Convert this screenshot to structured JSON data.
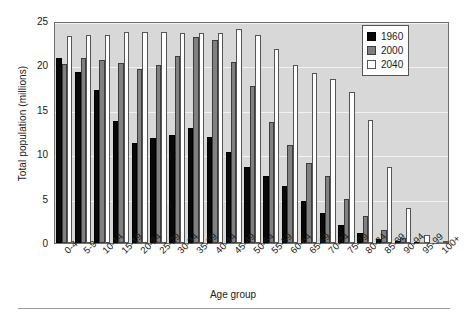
{
  "chart_data": {
    "type": "bar",
    "title": "",
    "xlabel": "Age group",
    "ylabel": "Total population (millions)",
    "categories": [
      "0-4",
      "5-9",
      "10-14",
      "15-19",
      "20-24",
      "25-29",
      "30-34",
      "35-39",
      "40-44",
      "45-49",
      "50-54",
      "55-59",
      "60-64",
      "65-69",
      "70-74",
      "75-79",
      "80-84",
      "85-89",
      "90-94",
      "95-99",
      "100+"
    ],
    "ylim": [
      0,
      25
    ],
    "yticks": [
      0,
      5,
      10,
      15,
      20,
      25
    ],
    "grid": true,
    "legend_position": "top-right",
    "series": [
      {
        "name": "1960",
        "color": "#080808",
        "values": [
          20.8,
          19.3,
          17.2,
          13.7,
          11.3,
          11.8,
          12.2,
          12.9,
          11.9,
          10.2,
          8.6,
          7.5,
          6.4,
          4.7,
          3.4,
          2.0,
          1.1,
          0.5,
          0.15,
          0.03,
          0.0
        ]
      },
      {
        "name": "2000",
        "color": "#808080",
        "values": [
          20.2,
          20.8,
          20.6,
          20.3,
          19.6,
          20.0,
          21.1,
          23.2,
          22.9,
          20.4,
          17.7,
          13.6,
          11.0,
          9.0,
          7.5,
          5.0,
          3.0,
          1.5,
          0.6,
          0.12,
          0.03
        ]
      },
      {
        "name": "2040",
        "color": "#ffffff",
        "values": [
          23.3,
          23.4,
          23.4,
          23.8,
          23.8,
          23.8,
          23.7,
          23.7,
          23.7,
          24.1,
          23.4,
          21.8,
          20.1,
          19.2,
          18.5,
          17.0,
          13.9,
          8.6,
          3.9,
          0.9,
          0.2
        ]
      }
    ]
  },
  "legend": {
    "items": [
      {
        "label": "1960",
        "key": "s1960"
      },
      {
        "label": "2000",
        "key": "s2000"
      },
      {
        "label": "2040",
        "key": "s2040"
      }
    ]
  }
}
